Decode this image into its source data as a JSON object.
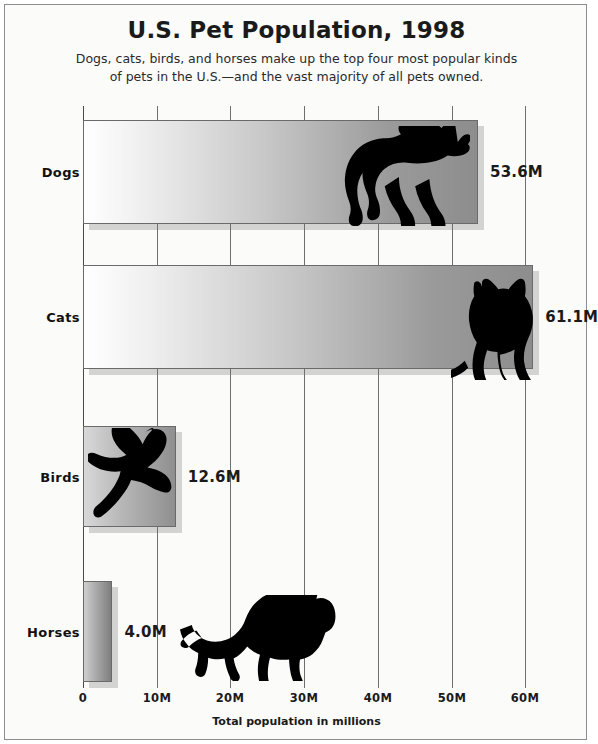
{
  "chart_data": {
    "type": "bar",
    "orientation": "horizontal",
    "title": "U.S. Pet Population, 1998",
    "subtitle": "Dogs, cats, birds, and horses make up the top four most popular kinds of pets in the U.S.—and the vast majority of all pets owned.",
    "categories": [
      "Dogs",
      "Cats",
      "Birds",
      "Horses"
    ],
    "values": [
      53.6,
      61.1,
      12.6,
      4.0
    ],
    "value_labels": [
      "53.6M",
      "61.1M",
      "12.6M",
      "4.0M"
    ],
    "xlabel": "Total population in millions",
    "ylabel": "",
    "xlim": [
      0,
      65
    ],
    "xticks": [
      0,
      10,
      20,
      30,
      40,
      50,
      60
    ],
    "xtick_labels": [
      "0",
      "10M",
      "20M",
      "30M",
      "40M",
      "50M",
      "60M"
    ],
    "grid": true,
    "legend": null,
    "units": "millions",
    "icons": [
      "dog-silhouette",
      "cat-silhouette",
      "bird-silhouette",
      "horse-silhouette"
    ],
    "colors": {
      "background": "#fbfbfa",
      "bar_gradient_start": "#ffffff",
      "bar_gradient_end": "#8d8d8d",
      "bar_border": "#6a6a6a",
      "gridline": "#6e6e6e",
      "text": "#1a1a1a",
      "silhouette": "#000000"
    }
  },
  "chart": {
    "title": "U.S. Pet Population, 1998",
    "subtitle_line1": "Dogs, cats, birds, and horses make up the top four most popular kinds",
    "subtitle_line2": "of pets in the U.S.—and the vast majority of all pets owned.",
    "xaxis_title": "Total population in millions",
    "rows": [
      {
        "label": "Dogs",
        "value": 53.6,
        "value_label": "53.6M",
        "icon": "dog-silhouette"
      },
      {
        "label": "Cats",
        "value": 61.1,
        "value_label": "61.1M",
        "icon": "cat-silhouette"
      },
      {
        "label": "Birds",
        "value": 12.6,
        "value_label": "12.6M",
        "icon": "bird-silhouette"
      },
      {
        "label": "Horses",
        "value": 4.0,
        "value_label": "4.0M",
        "icon": "horse-silhouette"
      }
    ],
    "ticks": [
      {
        "value": 0,
        "label": "0"
      },
      {
        "value": 10,
        "label": "10M"
      },
      {
        "value": 20,
        "label": "20M"
      },
      {
        "value": 30,
        "label": "30M"
      },
      {
        "value": 40,
        "label": "40M"
      },
      {
        "value": 50,
        "label": "50M"
      },
      {
        "value": 60,
        "label": "60M"
      }
    ]
  }
}
